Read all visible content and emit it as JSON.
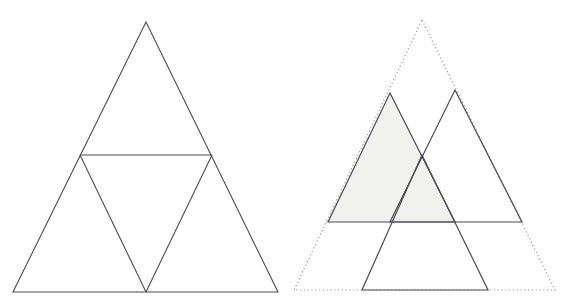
{
  "document": {
    "title": "Two geometric triangle figures",
    "width": 576,
    "height": 307,
    "background_color": "#ffffff"
  },
  "style": {
    "stroke_color": "#4a4a52",
    "stroke_width": 1.1,
    "dotted_stroke_color": "#9a9aa2",
    "dotted_stroke_width": 1.2,
    "dotted_dash_pattern": "1.2 2.6",
    "shade_fill_color": "#f1f1ef",
    "fill_none": "none"
  },
  "figures": [
    {
      "id": "left-figure",
      "name": "subdivided-triangle",
      "description": "Equilateral triangle subdivided by one horizontal midline and two cevians forming a central inverted triangle",
      "outer_triangle": {
        "name": "outer-triangle",
        "points": "146,22 278,292 13,292",
        "apex": [
          146,
          22
        ],
        "base_left": [
          13,
          292
        ],
        "base_right": [
          278,
          292
        ],
        "stroke": "#4a4a52",
        "fill": "none"
      },
      "midline": {
        "name": "horizontal-midline",
        "x1": 80,
        "y1": 155,
        "x2": 212,
        "y2": 155,
        "stroke": "#4a4a52"
      },
      "cevians": [
        {
          "name": "cevian-left",
          "x1": 80,
          "y1": 155,
          "x2": 146,
          "y2": 292,
          "stroke": "#4a4a52"
        },
        {
          "name": "cevian-right",
          "x1": 212,
          "y1": 155,
          "x2": 146,
          "y2": 292,
          "stroke": "#4a4a52"
        }
      ]
    },
    {
      "id": "right-figure",
      "name": "overlapping-triangles",
      "description": "Dotted outline of a large triangle with three overlapping solid half-size triangles, the left one shaded",
      "outline_triangle": {
        "name": "dotted-outline-triangle",
        "points": "422,20 555,290 294,290",
        "apex": [
          422,
          20
        ],
        "base_left": [
          294,
          290
        ],
        "base_right": [
          555,
          290
        ],
        "stroke": "#9a9aa2",
        "fill": "none",
        "dashed": true
      },
      "solid_triangles": [
        {
          "name": "shaded-triangle-left",
          "points": "390,93 455,222 328,222",
          "apex": [
            390,
            93
          ],
          "base_left": [
            328,
            222
          ],
          "base_right": [
            455,
            222
          ],
          "stroke": "#4a4a52",
          "fill": "#f1f1ef",
          "shaded": true
        },
        {
          "name": "triangle-right",
          "points": "455,90 522,222 390,222",
          "apex": [
            455,
            90
          ],
          "base_left": [
            390,
            222
          ],
          "base_right": [
            522,
            222
          ],
          "stroke": "#4a4a52",
          "fill": "none",
          "shaded": false
        },
        {
          "name": "triangle-bottom",
          "points": "422,155 488,290 362,290",
          "apex": [
            422,
            155
          ],
          "base_left": [
            362,
            290
          ],
          "base_right": [
            488,
            290
          ],
          "stroke": "#4a4a52",
          "fill": "none",
          "shaded": false
        }
      ]
    }
  ]
}
